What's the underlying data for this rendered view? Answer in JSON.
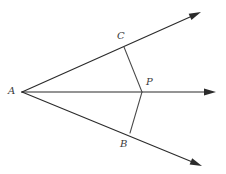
{
  "figure": {
    "background_color": "#ffffff",
    "line_color": "#2b2b2b",
    "segment_color": "#4a4a4a",
    "label_color": "#3a3a3a",
    "width": 226,
    "height": 174
  },
  "labels": {
    "vertex_a": "A",
    "point_c": "C",
    "point_p": "P",
    "point_b": "B"
  },
  "points": {
    "A": {
      "x": 22,
      "y": 92
    },
    "C": {
      "x": 124,
      "y": 47
    },
    "P": {
      "x": 142,
      "y": 92
    },
    "B": {
      "x": 130,
      "y": 133
    }
  },
  "rays": [
    {
      "name": "ray-upper",
      "from": {
        "x": 22,
        "y": 92
      },
      "to": {
        "x": 201,
        "y": 12
      },
      "arrow": true
    },
    {
      "name": "ray-middle",
      "from": {
        "x": 22,
        "y": 92
      },
      "to": {
        "x": 216,
        "y": 92
      },
      "arrow": true
    },
    {
      "name": "ray-lower",
      "from": {
        "x": 22,
        "y": 92
      },
      "to": {
        "x": 202,
        "y": 166
      },
      "arrow": true
    }
  ],
  "segments": [
    {
      "name": "segment-cp",
      "from": {
        "x": 124,
        "y": 47
      },
      "to": {
        "x": 142,
        "y": 92
      }
    },
    {
      "name": "segment-pb",
      "from": {
        "x": 142,
        "y": 92
      },
      "to": {
        "x": 130,
        "y": 133
      }
    }
  ],
  "label_positions": {
    "A": {
      "left": 8,
      "top": 86
    },
    "C": {
      "left": 117,
      "top": 31
    },
    "P": {
      "left": 146,
      "top": 77
    },
    "B": {
      "left": 120,
      "top": 139
    }
  }
}
